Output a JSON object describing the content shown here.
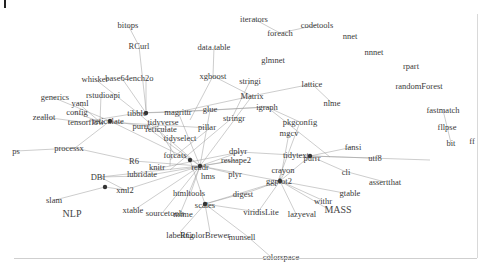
{
  "graph": {
    "title": "",
    "edge_color": "#9a9a9a",
    "label_color": "#3a3a3a",
    "nodes": [
      {
        "id": "bitops",
        "x": 128,
        "y": 25
      },
      {
        "id": "RCurl",
        "x": 139,
        "y": 46
      },
      {
        "id": "iterators",
        "x": 254,
        "y": 19
      },
      {
        "id": "codetools",
        "x": 317,
        "y": 25
      },
      {
        "id": "foreach",
        "x": 280,
        "y": 33
      },
      {
        "id": "nnet",
        "x": 350,
        "y": 36
      },
      {
        "id": "nnnet",
        "x": 374,
        "y": 52
      },
      {
        "id": "rpart",
        "x": 411,
        "y": 66
      },
      {
        "id": "randomForest",
        "x": 419,
        "y": 86
      },
      {
        "id": "fastmatch",
        "x": 443,
        "y": 110
      },
      {
        "id": "fllpse",
        "x": 447,
        "y": 127
      },
      {
        "id": "bit",
        "x": 451,
        "y": 143
      },
      {
        "id": "ff",
        "x": 472,
        "y": 141
      },
      {
        "id": "data.table",
        "x": 214,
        "y": 47
      },
      {
        "id": "glmnet",
        "x": 273,
        "y": 60
      },
      {
        "id": "xgboost",
        "x": 213,
        "y": 76
      },
      {
        "id": "stringi",
        "x": 250,
        "y": 81
      },
      {
        "id": "lattice",
        "x": 312,
        "y": 84
      },
      {
        "id": "nlme",
        "x": 332,
        "y": 103
      },
      {
        "id": "Matrix",
        "x": 252,
        "y": 96
      },
      {
        "id": "igraph",
        "x": 267,
        "y": 107
      },
      {
        "id": "pkgconfig",
        "x": 300,
        "y": 122
      },
      {
        "id": "magrittr",
        "x": 178,
        "y": 112
      },
      {
        "id": "glue",
        "x": 210,
        "y": 110
      },
      {
        "id": "stringr",
        "x": 232,
        "y": 118
      },
      {
        "id": "pillar",
        "x": 210,
        "y": 128
      },
      {
        "id": "mgcv",
        "x": 289,
        "y": 133
      },
      {
        "id": "whisker",
        "x": 95,
        "y": 79
      },
      {
        "id": "base64enc",
        "x": 121,
        "y": 77
      },
      {
        "id": "h2o",
        "x": 146,
        "y": 77
      },
      {
        "id": "rstudioapi",
        "x": 101,
        "y": 95
      },
      {
        "id": "generics",
        "x": 52,
        "y": 97
      },
      {
        "id": "yaml",
        "x": 78,
        "y": 103
      },
      {
        "id": "config",
        "x": 74,
        "y": 112
      },
      {
        "id": "tibble",
        "x": 138,
        "y": 113
      },
      {
        "id": "zeallot",
        "x": 43,
        "y": 117
      },
      {
        "id": "tensorflow",
        "x": 82,
        "y": 122
      },
      {
        "id": "reticulate",
        "x": 106,
        "y": 122
      },
      {
        "id": "keras",
        "x": 110,
        "y": 121
      },
      {
        "id": "purrr",
        "x": 145,
        "y": 126
      },
      {
        "id": "forcats",
        "x": 158,
        "y": 129
      },
      {
        "id": "tidyselect",
        "x": 171,
        "y": 138
      },
      {
        "id": "processx",
        "x": 75,
        "y": 148
      },
      {
        "id": "ps",
        "x": 16,
        "y": 151
      },
      {
        "id": "R6",
        "x": 134,
        "y": 161
      },
      {
        "id": "dplyr",
        "x": 240,
        "y": 152
      },
      {
        "id": "reshape2",
        "x": 237,
        "y": 160
      },
      {
        "id": "plyr",
        "x": 234,
        "y": 174
      },
      {
        "id": "tidyr",
        "x": 157,
        "y": 168
      },
      {
        "id": "lazyeval",
        "x": 148,
        "y": 171
      },
      {
        "id": "rlang",
        "x": 182,
        "y": 168
      },
      {
        "id": "Rcpp",
        "x": 198,
        "y": 166
      },
      {
        "id": "DBI",
        "x": 100,
        "y": 177
      },
      {
        "id": "knitr",
        "x": 143,
        "y": 176
      },
      {
        "id": "xml2",
        "x": 125,
        "y": 190
      },
      {
        "id": "slam",
        "x": 55,
        "y": 200
      },
      {
        "id": "NLP",
        "x": 72,
        "y": 214
      },
      {
        "id": "xtable",
        "x": 134,
        "y": 210
      },
      {
        "id": "sourcetools",
        "x": 163,
        "y": 212
      },
      {
        "id": "mime",
        "x": 180,
        "y": 214
      },
      {
        "id": "htmltools",
        "x": 190,
        "y": 195
      },
      {
        "id": "digest",
        "x": 252,
        "y": 191
      },
      {
        "id": "scales",
        "x": 205,
        "y": 204
      },
      {
        "id": "viridisLite",
        "x": 258,
        "y": 212
      },
      {
        "id": "labeling",
        "x": 180,
        "y": 232
      },
      {
        "id": "RColorBrewer",
        "x": 210,
        "y": 232
      },
      {
        "id": "munsell",
        "x": 247,
        "y": 236
      },
      {
        "id": "colorspace",
        "x": 271,
        "y": 257
      },
      {
        "id": "tidytext",
        "x": 301,
        "y": 156
      },
      {
        "id": "purrrlyr",
        "x": 315,
        "y": 158
      },
      {
        "id": "fansi",
        "x": 353,
        "y": 147
      },
      {
        "id": "utf8",
        "x": 371,
        "y": 158
      },
      {
        "id": "crayon",
        "x": 286,
        "y": 170
      },
      {
        "id": "cli",
        "x": 344,
        "y": 171
      },
      {
        "id": "assertthat",
        "x": 385,
        "y": 182
      },
      {
        "id": "ggplot2",
        "x": 280,
        "y": 181
      },
      {
        "id": "gtable",
        "x": 344,
        "y": 193
      },
      {
        "id": "withr",
        "x": 322,
        "y": 200
      },
      {
        "id": "MASS",
        "x": 328,
        "y": 209
      },
      {
        "id": "lazyeval2",
        "x": 296,
        "y": 214
      }
    ],
    "labels": [
      {
        "text": "bitops",
        "x": 128,
        "y": 25
      },
      {
        "text": "RCurl",
        "x": 139,
        "y": 46
      },
      {
        "text": "iterators",
        "x": 254,
        "y": 19
      },
      {
        "text": "codetools",
        "x": 317,
        "y": 25
      },
      {
        "text": "foreach",
        "x": 280,
        "y": 33
      },
      {
        "text": "nnet",
        "x": 350,
        "y": 36
      },
      {
        "text": "nnnet",
        "x": 374,
        "y": 52
      },
      {
        "text": "rpart",
        "x": 411,
        "y": 66
      },
      {
        "text": "randomForest",
        "x": 419,
        "y": 86
      },
      {
        "text": "fastmatch",
        "x": 443,
        "y": 110
      },
      {
        "text": "fllpse",
        "x": 447,
        "y": 127
      },
      {
        "text": "bit",
        "x": 451,
        "y": 143
      },
      {
        "text": "ff",
        "x": 472,
        "y": 141
      },
      {
        "text": "data.table",
        "x": 214,
        "y": 47
      },
      {
        "text": "glmnet",
        "x": 273,
        "y": 60
      },
      {
        "text": "xgboost",
        "x": 213,
        "y": 76
      },
      {
        "text": "stringi",
        "x": 250,
        "y": 81
      },
      {
        "text": "lattice",
        "x": 312,
        "y": 84
      },
      {
        "text": "nlme",
        "x": 332,
        "y": 103
      },
      {
        "text": "Matrix",
        "x": 252,
        "y": 96
      },
      {
        "text": "igraph",
        "x": 267,
        "y": 107
      },
      {
        "text": "pkgconfig",
        "x": 300,
        "y": 122
      },
      {
        "text": "magrittr",
        "x": 178,
        "y": 112
      },
      {
        "text": "glue",
        "x": 210,
        "y": 109
      },
      {
        "text": "stringr",
        "x": 234,
        "y": 118
      },
      {
        "text": "pillar",
        "x": 207,
        "y": 127
      },
      {
        "text": "mgcv",
        "x": 289,
        "y": 133
      },
      {
        "text": "whisker",
        "x": 95,
        "y": 79
      },
      {
        "text": "base64enc",
        "x": 123,
        "y": 78
      },
      {
        "text": "h2o",
        "x": 147,
        "y": 78
      },
      {
        "text": "rstudioapi",
        "x": 103,
        "y": 95
      },
      {
        "text": "generics",
        "x": 55,
        "y": 97
      },
      {
        "text": "yaml",
        "x": 80,
        "y": 103
      },
      {
        "text": "config",
        "x": 77,
        "y": 112
      },
      {
        "text": "tibble",
        "x": 137,
        "y": 113
      },
      {
        "text": "zeallot",
        "x": 44,
        "y": 117
      },
      {
        "text": "tensorflow",
        "x": 86,
        "y": 122
      },
      {
        "text": "reticulate",
        "x": 108,
        "y": 121
      },
      {
        "text": "purrr",
        "x": 141,
        "y": 126
      },
      {
        "text": "reticulate",
        "x": 161,
        "y": 129
      },
      {
        "text": "tidyselect",
        "x": 180,
        "y": 138
      },
      {
        "text": "processx",
        "x": 69,
        "y": 148
      },
      {
        "text": "ps",
        "x": 16,
        "y": 151
      },
      {
        "text": "R6",
        "x": 134,
        "y": 161
      },
      {
        "text": "dplyr",
        "x": 238,
        "y": 151
      },
      {
        "text": "reshape2",
        "x": 236,
        "y": 160
      },
      {
        "text": "plyr",
        "x": 235,
        "y": 174
      },
      {
        "text": "forcats",
        "x": 175,
        "y": 155
      },
      {
        "text": "knitr",
        "x": 157,
        "y": 167
      },
      {
        "text": "lubridate",
        "x": 142,
        "y": 174
      },
      {
        "text": "DBI",
        "x": 98,
        "y": 177
      },
      {
        "text": "xml2",
        "x": 125,
        "y": 190
      },
      {
        "text": "slam",
        "x": 54,
        "y": 200
      },
      {
        "text": "NLP",
        "x": 72,
        "y": 214
      },
      {
        "text": "xtable",
        "x": 133,
        "y": 210
      },
      {
        "text": "sourcetools",
        "x": 165,
        "y": 213
      },
      {
        "text": "mime",
        "x": 183,
        "y": 214
      },
      {
        "text": "htmltools",
        "x": 189,
        "y": 193
      },
      {
        "text": "digest",
        "x": 243,
        "y": 194
      },
      {
        "text": "scales",
        "x": 205,
        "y": 205
      },
      {
        "text": "viridisLite",
        "x": 261,
        "y": 212
      },
      {
        "text": "labeling",
        "x": 180,
        "y": 235
      },
      {
        "text": "RColorBrewer",
        "x": 205,
        "y": 235
      },
      {
        "text": "munsell",
        "x": 242,
        "y": 237
      },
      {
        "text": "colorspace",
        "x": 281,
        "y": 257
      },
      {
        "text": "tidytext",
        "x": 296,
        "y": 155
      },
      {
        "text": "purrr",
        "x": 312,
        "y": 158
      },
      {
        "text": "fansi",
        "x": 353,
        "y": 147
      },
      {
        "text": "utf8",
        "x": 375,
        "y": 158
      },
      {
        "text": "crayon",
        "x": 283,
        "y": 170
      },
      {
        "text": "cli",
        "x": 346,
        "y": 172
      },
      {
        "text": "assertthat",
        "x": 385,
        "y": 182
      },
      {
        "text": "ggplot2",
        "x": 279,
        "y": 181
      },
      {
        "text": "gtable",
        "x": 350,
        "y": 193
      },
      {
        "text": "withr",
        "x": 323,
        "y": 201
      },
      {
        "text": "MASS",
        "x": 338,
        "y": 210
      },
      {
        "text": "lazyeval",
        "x": 302,
        "y": 214
      },
      {
        "text": "readr",
        "x": 200,
        "y": 167
      },
      {
        "text": "hms",
        "x": 208,
        "y": 176
      },
      {
        "text": "tidyverse",
        "x": 163,
        "y": 122
      }
    ],
    "edges": [
      [
        128,
        25,
        139,
        46
      ],
      [
        139,
        46,
        146,
        110
      ],
      [
        254,
        19,
        280,
        33
      ],
      [
        317,
        25,
        280,
        33
      ],
      [
        214,
        47,
        213,
        76
      ],
      [
        213,
        76,
        190,
        120
      ],
      [
        213,
        76,
        252,
        96
      ],
      [
        250,
        81,
        232,
        118
      ],
      [
        252,
        96,
        312,
        84
      ],
      [
        252,
        96,
        178,
        112
      ],
      [
        252,
        96,
        200,
        166
      ],
      [
        267,
        107,
        210,
        110
      ],
      [
        267,
        107,
        300,
        122
      ],
      [
        267,
        107,
        330,
        157
      ],
      [
        267,
        107,
        178,
        112
      ],
      [
        312,
        84,
        332,
        103
      ],
      [
        300,
        122,
        278,
        181
      ],
      [
        443,
        110,
        451,
        143
      ],
      [
        95,
        79,
        138,
        113
      ],
      [
        121,
        77,
        146,
        113
      ],
      [
        146,
        77,
        146,
        113
      ],
      [
        101,
        95,
        100,
        122
      ],
      [
        52,
        97,
        110,
        121
      ],
      [
        78,
        103,
        100,
        122
      ],
      [
        74,
        112,
        100,
        122
      ],
      [
        43,
        117,
        82,
        122
      ],
      [
        82,
        122,
        138,
        113
      ],
      [
        110,
        121,
        170,
        130
      ],
      [
        138,
        113,
        210,
        110
      ],
      [
        138,
        113,
        178,
        112
      ],
      [
        138,
        113,
        200,
        166
      ],
      [
        106,
        122,
        210,
        128
      ],
      [
        110,
        121,
        190,
        160
      ],
      [
        75,
        148,
        16,
        151
      ],
      [
        75,
        148,
        134,
        161
      ],
      [
        110,
        121,
        75,
        148
      ],
      [
        134,
        161,
        200,
        166
      ],
      [
        100,
        177,
        200,
        166
      ],
      [
        100,
        177,
        143,
        176
      ],
      [
        100,
        177,
        125,
        190
      ],
      [
        55,
        200,
        105,
        187
      ],
      [
        105,
        187,
        125,
        190
      ],
      [
        125,
        190,
        200,
        166
      ],
      [
        134,
        210,
        200,
        166
      ],
      [
        163,
        212,
        200,
        166
      ],
      [
        180,
        214,
        200,
        166
      ],
      [
        190,
        195,
        200,
        166
      ],
      [
        252,
        191,
        205,
        204
      ],
      [
        205,
        204,
        280,
        181
      ],
      [
        258,
        212,
        205,
        204
      ],
      [
        180,
        232,
        205,
        204
      ],
      [
        210,
        232,
        205,
        204
      ],
      [
        247,
        236,
        205,
        204
      ],
      [
        247,
        236,
        271,
        257
      ],
      [
        205,
        204,
        190,
        160
      ],
      [
        200,
        166,
        240,
        152
      ],
      [
        200,
        166,
        237,
        160
      ],
      [
        200,
        166,
        234,
        174
      ],
      [
        240,
        152,
        310,
        156
      ],
      [
        310,
        156,
        353,
        147
      ],
      [
        310,
        156,
        371,
        158
      ],
      [
        310,
        156,
        344,
        171
      ],
      [
        344,
        171,
        385,
        182
      ],
      [
        310,
        156,
        430,
        160
      ],
      [
        280,
        181,
        310,
        156
      ],
      [
        280,
        181,
        286,
        170
      ],
      [
        280,
        181,
        344,
        193
      ],
      [
        280,
        181,
        322,
        200
      ],
      [
        280,
        181,
        328,
        209
      ],
      [
        280,
        181,
        258,
        212
      ],
      [
        280,
        181,
        252,
        191
      ],
      [
        280,
        181,
        296,
        214
      ],
      [
        280,
        181,
        200,
        166
      ],
      [
        280,
        181,
        289,
        133
      ],
      [
        171,
        138,
        170,
        166
      ],
      [
        158,
        129,
        175,
        155
      ],
      [
        145,
        126,
        200,
        166
      ],
      [
        178,
        112,
        200,
        166
      ],
      [
        210,
        110,
        200,
        166
      ],
      [
        232,
        118,
        170,
        170
      ],
      [
        210,
        128,
        170,
        160
      ],
      [
        240,
        152,
        150,
        170
      ],
      [
        237,
        160,
        150,
        175
      ]
    ]
  }
}
